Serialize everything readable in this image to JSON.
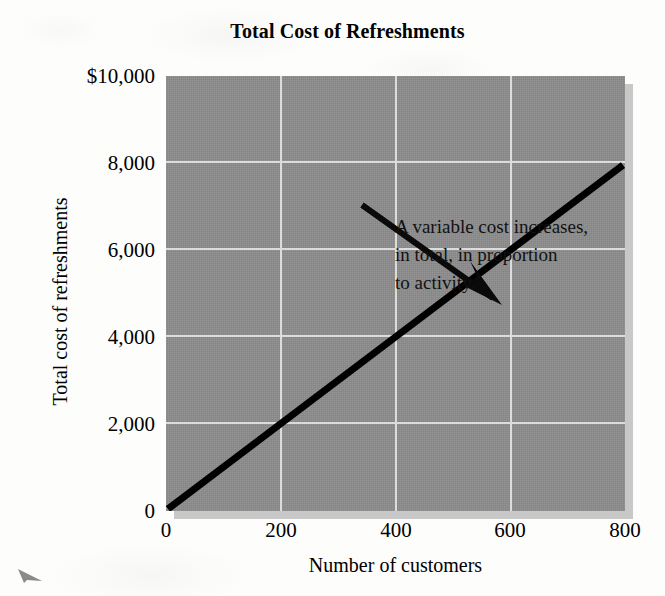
{
  "chart_data": {
    "type": "line",
    "title": "Total Cost of Refreshments",
    "xlabel": "Number of customers",
    "ylabel": "Total cost of refreshments",
    "xlim": [
      0,
      800
    ],
    "ylim": [
      0,
      10000
    ],
    "xticks": [
      "0",
      "200",
      "400",
      "600",
      "800"
    ],
    "xtick_values": [
      0,
      200,
      400,
      600,
      800
    ],
    "yticks": [
      "0",
      "2,000",
      "4,000",
      "6,000",
      "8,000",
      "$10,000"
    ],
    "ytick_values": [
      0,
      2000,
      4000,
      6000,
      8000,
      10000
    ],
    "grid": true,
    "legend": "none",
    "series": [
      {
        "name": "Total cost of refreshments",
        "x": [
          0,
          800
        ],
        "values": [
          0,
          8000
        ],
        "slope_per_customer": 10,
        "color": "#000000"
      }
    ],
    "annotations": [
      {
        "text": "A variable cost increases, in total, in proportion to activity.",
        "lines": [
          "A variable cost increases,",
          "in total, in proportion",
          "to activity."
        ],
        "arrow_from": [
          340,
          7000
        ],
        "arrow_to": [
          530,
          5300
        ]
      }
    ]
  },
  "style": {
    "plot_background": "#8d8d8d",
    "grid_color": "#dcdcdc",
    "line_color": "#000000",
    "page_background": "#fdfdfc",
    "shadow_color": "#c8c8c8"
  },
  "icons": {
    "annotation_arrow": "arrow-down-right-icon",
    "stray_mark": "stray-arrow-mark-icon"
  }
}
